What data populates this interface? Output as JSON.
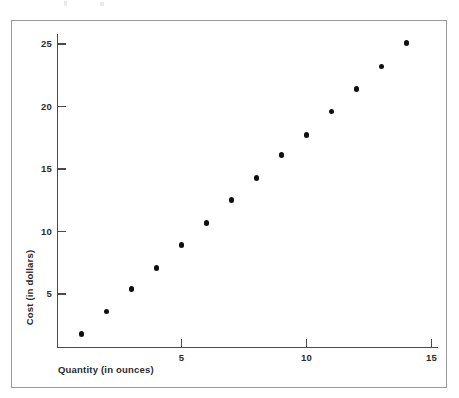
{
  "chart_data": {
    "type": "scatter",
    "title": "",
    "xlabel": "Quantity (in ounces)",
    "ylabel": "Cost (in dollars)",
    "xlim": [
      0,
      15.3
    ],
    "ylim": [
      0,
      25.8
    ],
    "grid": false,
    "legend": null,
    "x_ticks": [
      5,
      10,
      15
    ],
    "x_tick_labels": [
      "5",
      "10",
      "15"
    ],
    "y_ticks": [
      5,
      10,
      15,
      20,
      25
    ],
    "y_tick_labels": [
      "5",
      "10",
      "15",
      "20",
      "25"
    ],
    "marker": "filled-circle",
    "marker_color": "#101010",
    "axis_color": "#4a4a4a",
    "frame_color": "#9a9a9a",
    "x": [
      1,
      2,
      3,
      4,
      5,
      6,
      7,
      8,
      9,
      10,
      11,
      12,
      13,
      14
    ],
    "y": [
      1.8,
      3.6,
      5.4,
      7.1,
      8.9,
      10.7,
      12.5,
      14.3,
      16.1,
      17.7,
      19.6,
      21.4,
      23.2,
      25.1
    ],
    "points": [
      {
        "x": 1,
        "y": 1.8
      },
      {
        "x": 2,
        "y": 3.6
      },
      {
        "x": 3,
        "y": 5.4
      },
      {
        "x": 4,
        "y": 7.1
      },
      {
        "x": 5,
        "y": 8.9
      },
      {
        "x": 6,
        "y": 10.7
      },
      {
        "x": 7,
        "y": 12.5
      },
      {
        "x": 8,
        "y": 14.3
      },
      {
        "x": 9,
        "y": 16.1
      },
      {
        "x": 10,
        "y": 17.7
      },
      {
        "x": 11,
        "y": 19.6
      },
      {
        "x": 12,
        "y": 21.4
      },
      {
        "x": 13,
        "y": 23.2
      },
      {
        "x": 14,
        "y": 25.1
      }
    ]
  }
}
